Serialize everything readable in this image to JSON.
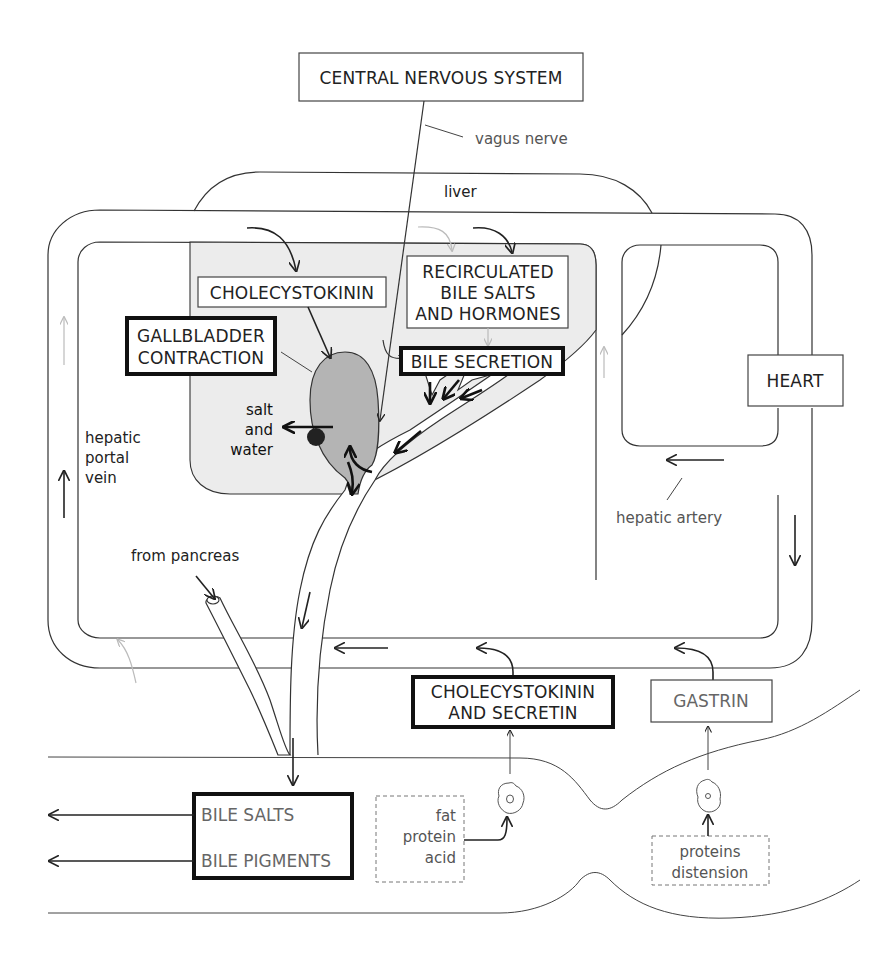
{
  "diagram": {
    "boxes": {
      "cns": "CENTRAL NERVOUS SYSTEM",
      "cholecystokinin": "CHOLECYSTOKININ",
      "recirculated_line1": "RECIRCULATED",
      "recirculated_line2": "BILE SALTS",
      "recirculated_line3": "AND HORMONES",
      "gallbladder_line1": "GALLBLADDER",
      "gallbladder_line2": "CONTRACTION",
      "bile_secretion": "BILE SECRETION",
      "heart": "HEART",
      "cck_secretin_line1": "CHOLECYSTOKININ",
      "cck_secretin_line2": "AND SECRETIN",
      "gastrin": "GASTRIN",
      "bile_salts": "BILE SALTS",
      "bile_pigments": "BILE PIGMENTS",
      "stim_fat": "fat",
      "stim_protein": "protein",
      "stim_acid": "acid",
      "stim_proteins": "proteins",
      "stim_distension": "distension"
    },
    "labels": {
      "vagus_nerve": "vagus nerve",
      "liver": "liver",
      "salt": "salt",
      "and": "and",
      "water": "water",
      "hepatic": "hepatic",
      "portal": "portal",
      "vein": "vein",
      "hepatic_artery": "hepatic artery",
      "from_pancreas": "from pancreas"
    },
    "colors": {
      "gallbladder_fill": "#b4b4b4",
      "liver_fill": "#ececec",
      "stroke": "#333333"
    }
  }
}
